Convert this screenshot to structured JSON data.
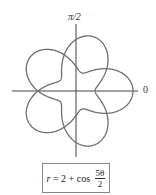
{
  "diagram": {
    "type": "polar-curve",
    "axis_labels": {
      "top": "π/2",
      "right": "0"
    },
    "curve": {
      "equation_lhs": "r",
      "equation_mid": " = 2 + cos ",
      "frac_num": "5θ",
      "frac_den": "2",
      "constant": 2,
      "coefficient": 5,
      "divisor": 2,
      "theta_range": [
        0,
        12.566
      ],
      "color": "#6f6f6f"
    },
    "axes_color": "#444444"
  }
}
